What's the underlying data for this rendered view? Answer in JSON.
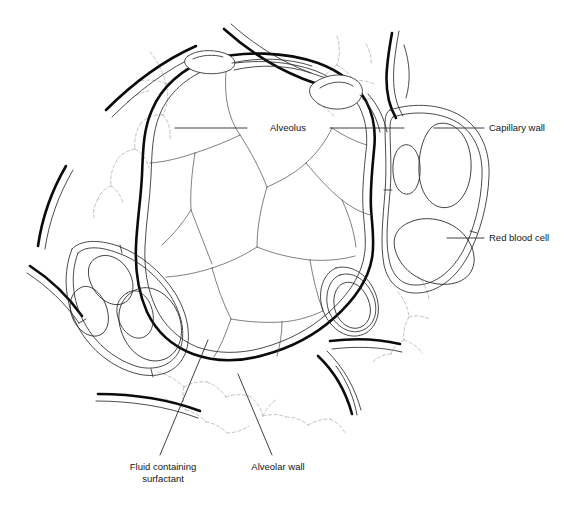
{
  "figure": {
    "background_color": "#ffffff",
    "ink_color": "#0b0b0b",
    "fiber_color": "#a8a8a8",
    "width": 577,
    "height": 507
  },
  "labels": [
    {
      "id": "alveolus",
      "text": "Alveolus",
      "anchor": "middle",
      "x": 288,
      "y": 131,
      "leader": "M 175 128 L 247 128 M 330 128 L 404 128"
    },
    {
      "id": "capillary-wall",
      "text": "Capillary wall",
      "anchor": "start",
      "x": 489,
      "y": 131,
      "leader": "M 434 128 L 484 128"
    },
    {
      "id": "red-blood-cell",
      "text": "Red blood cell",
      "anchor": "start",
      "x": 489,
      "y": 241,
      "leader": "M 447 238 L 484 238"
    },
    {
      "id": "fluid-containing-surfactant",
      "text": "Fluid containing",
      "text2": "surfactant",
      "anchor": "middle",
      "x": 163,
      "y": 470,
      "y2": 482,
      "leader": "M 208 340 L 160 455"
    },
    {
      "id": "alveolar-wall",
      "text": "Alveolar wall",
      "anchor": "middle",
      "x": 278,
      "y": 470,
      "leader": "M 238 374 L 272 455"
    }
  ],
  "structures": {
    "alveolar_wall_outer": "thick black outline of the central alveolus",
    "alveolar_wall_inner": "thin parallel line representing fluid/surfactant layer",
    "epithelial_cells": "thin polygon boundary lines inside the alveolar lumen",
    "capillary_right": "large capillary at right containing two red blood cells",
    "capillary_left": "oblique capillary at left containing three red blood cells",
    "capillary_top": "flattened capillary segments along the top wall",
    "capillary_lower_right": "capillary segment at lower right of alveolus",
    "neighbouring_alveoli": "thick arcs radiating outward representing adjacent alveoli",
    "connective_tissue": "faint dashed branching elastic fibres in interstitial spaces"
  }
}
